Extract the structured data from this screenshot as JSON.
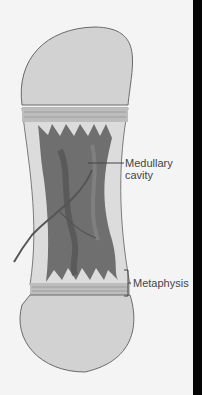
{
  "diagram": {
    "labels": [
      {
        "id": "medullary",
        "lines": [
          "Medullary",
          "cavity"
        ]
      },
      {
        "id": "metaphysis",
        "lines": [
          "Metaphysis"
        ]
      }
    ],
    "colors": {
      "background": "#f4f4f4",
      "epiphysis_fill": "#d2d2d2",
      "outline": "#6a6a6a",
      "marrow": "#6f6f6f",
      "marrow_dark": "#4c4c4c",
      "growth_plate": "#b8b8b8",
      "label_text": "#444444",
      "right_edge": "#050505"
    }
  }
}
